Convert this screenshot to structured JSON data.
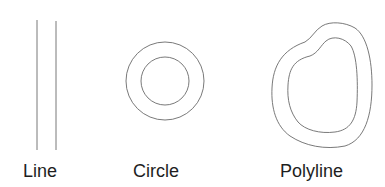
{
  "colors": {
    "stroke": "#6a6a6a",
    "text": "#1e1e1e",
    "background": "#ffffff"
  },
  "shapes": [
    {
      "id": "line",
      "label": "Line"
    },
    {
      "id": "circle",
      "label": "Circle"
    },
    {
      "id": "polyline",
      "label": "Polyline"
    }
  ]
}
